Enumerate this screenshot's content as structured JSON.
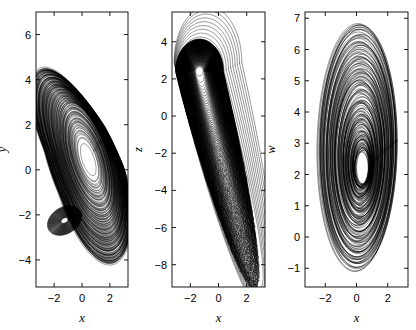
{
  "figure": {
    "background": "#ffffff",
    "ink": "#000000",
    "width": 416,
    "height": 330,
    "panel_count": 3
  },
  "chart_data": [
    {
      "type": "line",
      "name": "panel-xy",
      "title": "",
      "xlabel": "x",
      "ylabel": "y",
      "xlim": [
        -3.3,
        3.3
      ],
      "ylim": [
        -5.2,
        7.0
      ],
      "xticks": [
        -2,
        0,
        2
      ],
      "xticklabels": [
        "−2",
        "0",
        "2"
      ],
      "yticks": [
        6,
        4,
        2,
        0,
        -2,
        -4
      ],
      "yticklabels": [
        "6",
        "4",
        "2",
        "0",
        "−2",
        "−4"
      ],
      "grid": false,
      "legend": "none",
      "frame_px": {
        "left": 36,
        "top": 12,
        "right": 128,
        "bottom": 287
      },
      "description": "Chaotic attractor projection onto the x-y plane: a tilted elliptical spiral band with a blank elongated core near x=0.5, y=0.4 and a secondary folding lobe near x=-1.2, y=-2.2.",
      "attractor": {
        "kind": "spiral-band",
        "center": [
          0.45,
          0.45
        ],
        "tilt_deg": 34,
        "rx_min": 0.42,
        "rx_max": 2.6,
        "ry_min": 0.85,
        "ry_max": 5.3,
        "turns": 150,
        "fold_center": [
          -1.25,
          -2.25
        ],
        "fold_rx": 1.25,
        "fold_ry": 0.62,
        "fold_tilt_deg": 12,
        "samples": 520
      }
    },
    {
      "type": "line",
      "name": "panel-xz",
      "title": "",
      "xlabel": "x",
      "ylabel": "z",
      "xlim": [
        -3.3,
        3.3
      ],
      "ylim": [
        -9.2,
        5.6
      ],
      "xticks": [
        -2,
        0,
        2
      ],
      "xticklabels": [
        "−2",
        "0",
        "2"
      ],
      "yticks": [
        4,
        2,
        0,
        -2,
        -4,
        -6,
        -8
      ],
      "yticklabels": [
        "4",
        "2",
        "0",
        "−2",
        "−4",
        "−6",
        "−8"
      ],
      "grid": false,
      "legend": "none",
      "frame_px": {
        "left": 172,
        "top": 12,
        "right": 265,
        "bottom": 287
      },
      "description": "Projection onto the x-z plane: a crest of loops near z=2 to z=4 spanning x=-2.6 to x=0, trailing into a dense sheared plume descending to z=-8.5 near x=2.6.",
      "attractor": {
        "kind": "sheared-plume",
        "crest": [
          -1.35,
          2.4
        ],
        "crest_rx": 1.5,
        "crest_ry": 1.5,
        "tail_end": [
          2.55,
          -7.6
        ],
        "tail_width": 0.55,
        "turns": 150,
        "samples": 520
      }
    },
    {
      "type": "line",
      "name": "panel-xw",
      "title": "",
      "xlabel": "x",
      "ylabel": "w",
      "xlim": [
        -3.3,
        3.3
      ],
      "ylim": [
        -1.6,
        7.2
      ],
      "xticks": [
        -2,
        0,
        2
      ],
      "xticklabels": [
        "−2",
        "0",
        "2"
      ],
      "yticks": [
        7,
        6,
        5,
        4,
        3,
        2,
        1,
        0,
        -1
      ],
      "yticklabels": [
        "7",
        "6",
        "5",
        "4",
        "3",
        "2",
        "1",
        "0",
        "−1"
      ],
      "grid": false,
      "legend": "none",
      "frame_px": {
        "left": 305,
        "top": 12,
        "right": 408,
        "bottom": 287
      },
      "description": "Projection onto the x-w plane: a family of nested, slightly tilted ellipses whose vertical extent shrinks from w in [-1.1, 6.9] down to a dense cluster around w = 2 to 3.",
      "attractor": {
        "kind": "nested-ellipses",
        "center_x": 0.1,
        "center_w_start": 2.9,
        "center_w_end": 2.2,
        "rx_max": 2.55,
        "rx_min": 0.45,
        "rw_max": 4.0,
        "rw_min": 0.55,
        "tilt_deg": 8,
        "count": 150,
        "samples": 260
      }
    }
  ]
}
